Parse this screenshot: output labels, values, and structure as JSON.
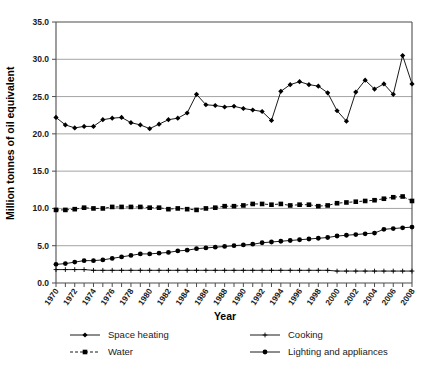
{
  "chart_data": {
    "type": "line",
    "title": "",
    "xlabel": "Year",
    "ylabel": "Million tonnes of oil equivalent",
    "xlim": [
      1970,
      2008
    ],
    "ylim": [
      0.0,
      35.0
    ],
    "yticks": [
      "0.0",
      "5.0",
      "10.0",
      "15.0",
      "20.0",
      "25.0",
      "30.0",
      "35.0"
    ],
    "ytick_values": [
      0,
      5,
      10,
      15,
      20,
      25,
      30,
      35
    ],
    "grid": "horizontal",
    "legend_position": "bottom",
    "x": [
      1970,
      1971,
      1972,
      1973,
      1974,
      1975,
      1976,
      1977,
      1978,
      1979,
      1980,
      1981,
      1982,
      1983,
      1984,
      1985,
      1986,
      1987,
      1988,
      1989,
      1990,
      1991,
      1992,
      1993,
      1994,
      1995,
      1996,
      1997,
      1998,
      1999,
      2000,
      2001,
      2002,
      2003,
      2004,
      2005,
      2006,
      2007,
      2008
    ],
    "xtick_labels": [
      "1970",
      "1972",
      "1974",
      "1976",
      "1978",
      "1980",
      "1982",
      "1984",
      "1986",
      "1988",
      "1990",
      "1992",
      "1994",
      "1996",
      "1998",
      "2000",
      "2002",
      "2004",
      "2006",
      "2008"
    ],
    "series": [
      {
        "name": "Space heating",
        "marker": "diamond",
        "line_style": "solid",
        "color": "#000000",
        "values": [
          22.2,
          21.2,
          20.8,
          21.0,
          21.0,
          21.9,
          22.1,
          22.2,
          21.5,
          21.2,
          20.7,
          21.3,
          21.9,
          22.1,
          22.8,
          25.3,
          23.9,
          23.8,
          23.6,
          23.7,
          23.4,
          23.2,
          23.0,
          21.8,
          25.7,
          26.6,
          27.0,
          26.6,
          26.4,
          25.5,
          23.1,
          21.7,
          25.6,
          27.2,
          26.0,
          26.7,
          25.3,
          30.5,
          26.7
        ]
      },
      {
        "name": "Water",
        "marker": "square",
        "line_style": "dashed",
        "color": "#000000",
        "values": [
          9.8,
          9.8,
          9.9,
          10.1,
          10.0,
          10.0,
          10.2,
          10.2,
          10.2,
          10.2,
          10.1,
          10.1,
          9.9,
          10.0,
          9.9,
          9.8,
          10.0,
          10.1,
          10.3,
          10.3,
          10.4,
          10.6,
          10.6,
          10.5,
          10.6,
          10.4,
          10.5,
          10.5,
          10.3,
          10.4,
          10.7,
          10.8,
          10.9,
          11.0,
          11.1,
          11.3,
          11.5,
          11.6,
          11.0
        ]
      },
      {
        "name": "Cooking",
        "marker": "plus",
        "line_style": "solid",
        "color": "#000000",
        "values": [
          1.8,
          1.8,
          1.8,
          1.8,
          1.7,
          1.7,
          1.7,
          1.7,
          1.7,
          1.7,
          1.7,
          1.7,
          1.7,
          1.7,
          1.7,
          1.7,
          1.7,
          1.7,
          1.7,
          1.7,
          1.7,
          1.7,
          1.7,
          1.7,
          1.7,
          1.7,
          1.7,
          1.7,
          1.7,
          1.7,
          1.6,
          1.6,
          1.6,
          1.6,
          1.6,
          1.6,
          1.6,
          1.6,
          1.6
        ]
      },
      {
        "name": "Lighting and appliances",
        "marker": "circle",
        "line_style": "solid",
        "color": "#000000",
        "values": [
          2.5,
          2.6,
          2.8,
          3.0,
          3.0,
          3.1,
          3.3,
          3.5,
          3.7,
          3.9,
          3.9,
          4.0,
          4.1,
          4.3,
          4.4,
          4.6,
          4.7,
          4.8,
          4.9,
          5.0,
          5.1,
          5.2,
          5.4,
          5.5,
          5.6,
          5.7,
          5.8,
          5.9,
          6.0,
          6.1,
          6.3,
          6.4,
          6.5,
          6.6,
          6.7,
          7.2,
          7.3,
          7.4,
          7.5
        ]
      }
    ]
  },
  "legend": {
    "entries": [
      {
        "label": "Space heating",
        "marker": "diamond",
        "style": "solid"
      },
      {
        "label": "Cooking",
        "marker": "plus",
        "style": "solid"
      },
      {
        "label": "Water",
        "marker": "square",
        "style": "dashed"
      },
      {
        "label": "Lighting and appliances",
        "marker": "circle",
        "style": "solid"
      }
    ]
  }
}
